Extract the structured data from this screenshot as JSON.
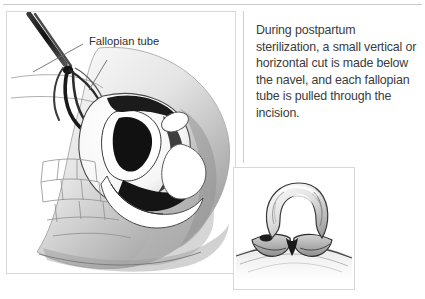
{
  "figure": {
    "type": "medical-illustration",
    "caption": "During postpartum sterilization, a small vertical or horizontal cut is made below the navel, and each fallopian tube is pulled through the incision.",
    "caption_lines": [
      "During postpartum sterili-",
      "zation, a small vertical or",
      "horizontal cut is made below",
      "the navel, and each fallopian",
      "tube is pulled through the",
      "incision."
    ]
  },
  "main_illustration": {
    "title": "Sagittal section of female pelvis with forceps grasping fallopian tube",
    "labels": [
      {
        "text": "Fallopian tube",
        "x": 82,
        "y": 40
      }
    ],
    "instrument": "forceps",
    "view": "sagittal cross-section"
  },
  "inset_illustration": {
    "title": "Fallopian tube loop drawn through abdominal incision",
    "view": "close-up of incision"
  },
  "colors": {
    "background": "#ffffff",
    "text": "#3b3b3b",
    "label_text": "#2f2f2f",
    "frame_border": "#d8d8d8",
    "rule": "#c9c9c9",
    "ink_dark": "#1a1a1a",
    "ink_mid": "#6e6e6e",
    "ink_light": "#bdbdbd",
    "tissue_fill": "#ffffff",
    "shadow_fill": "#9a9a9a"
  }
}
